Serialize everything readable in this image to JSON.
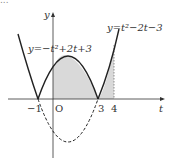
{
  "header": {
    "cut_text": "..."
  },
  "axes": {
    "x_label": "t",
    "y_label": "y",
    "origin_label": "O"
  },
  "ticks": {
    "neg1": "−1",
    "three": "3",
    "four": "4"
  },
  "curves": {
    "f_label": "y=−t²+2t+3",
    "g_label": "y=t²−2t−3"
  },
  "colors": {
    "curve": "#222222",
    "shade": "#d9d9d9",
    "axis": "#333333"
  }
}
